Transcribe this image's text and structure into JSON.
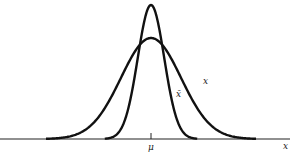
{
  "chart_data": {
    "type": "line",
    "title": "",
    "xlabel": "x",
    "ylabel": "",
    "grid": false,
    "legend": "none (curves labeled inline)",
    "x_ticks": [
      {
        "label": "μ",
        "position": 0
      }
    ],
    "x_range_sd_units": [
      -3.5,
      3.5
    ],
    "series": [
      {
        "name": "x",
        "label": "x",
        "description": "population distribution (wide normal curve)",
        "mean": 0,
        "sd": 1,
        "relative_peak_height": 1.0
      },
      {
        "name": "x-bar",
        "label": "x̄",
        "description": "sampling distribution of the mean (narrow normal curve)",
        "mean": 0,
        "sd": 0.44,
        "relative_peak_height": 1.33
      }
    ],
    "annotations": [
      "x",
      "x̄",
      "μ"
    ]
  },
  "labels": {
    "axis_x": "x",
    "mean_tick": "μ",
    "curve_wide": "x",
    "curve_narrow": "x̄"
  },
  "colors": {
    "curve": "#111111",
    "axis": "#222222",
    "background": "#ffffff"
  }
}
